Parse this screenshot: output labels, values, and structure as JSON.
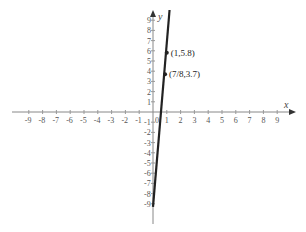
{
  "chart_data": {
    "type": "line",
    "title": "",
    "xlabel": "x",
    "ylabel": "y",
    "xlim": [
      -9,
      9
    ],
    "ylim": [
      -9,
      9
    ],
    "grid": false,
    "x_ticks": [
      -9,
      -8,
      -7,
      -6,
      -5,
      -4,
      -3,
      -2,
      -1,
      0,
      1,
      2,
      3,
      4,
      5,
      6,
      7,
      8,
      9
    ],
    "y_ticks": [
      -9,
      -8,
      -7,
      -6,
      -5,
      -4,
      -3,
      -2,
      -1,
      1,
      2,
      3,
      4,
      5,
      6,
      7,
      8,
      9
    ],
    "series": [
      {
        "name": "line",
        "points": [
          [
            0.0,
            -9.3
          ],
          [
            1.2,
            10.0
          ]
        ],
        "color": "#222222"
      }
    ],
    "annotations": [
      {
        "text": "(1,5.8)",
        "x": 1,
        "y": 5.8
      },
      {
        "text": "(7/8,3.7)",
        "x": 0.875,
        "y": 3.7
      }
    ]
  },
  "labels": {
    "x_axis": "x",
    "y_axis": "y",
    "origin": "0",
    "point_a": "(1,5.8)",
    "point_b": "(7/8,3.7)"
  }
}
